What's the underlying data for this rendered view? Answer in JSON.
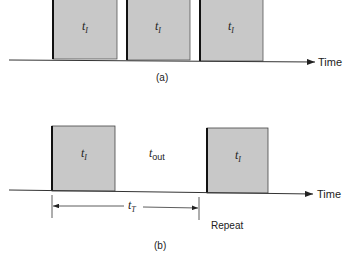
{
  "diagram": {
    "panel_a": {
      "caption": "(a)",
      "axis_label": "Time",
      "pulses": [
        {
          "label": "t",
          "sub": "I"
        },
        {
          "label": "t",
          "sub": "I"
        },
        {
          "label": "t",
          "sub": "I"
        }
      ]
    },
    "panel_b": {
      "caption": "(b)",
      "axis_label": "Time",
      "pulses": [
        {
          "label": "t",
          "sub": "I"
        },
        {
          "label": "t",
          "sub": "I"
        }
      ],
      "gap_label": {
        "label": "t",
        "sub": "out"
      },
      "period_label": {
        "label": "t",
        "sub": "T"
      },
      "repeat_label": "Repeat"
    },
    "colors": {
      "pulse_fill": "#c8c8c8",
      "stroke": "#222222"
    }
  }
}
